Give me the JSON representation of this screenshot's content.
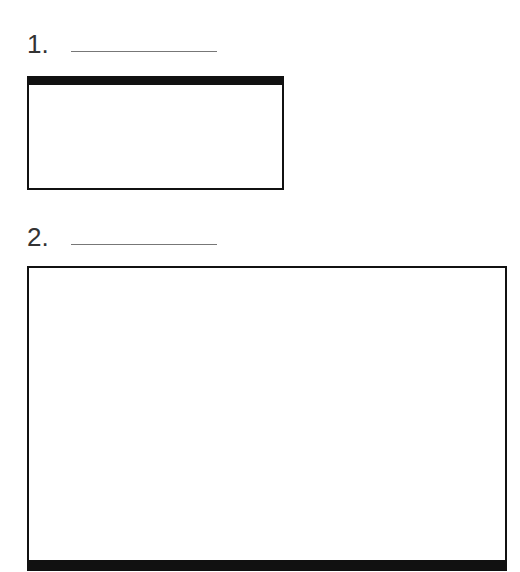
{
  "items": [
    {
      "label": "1.",
      "answer": "",
      "box": {
        "accent_edge": "top"
      }
    },
    {
      "label": "2.",
      "answer": "",
      "box": {
        "accent_edge": "bottom"
      }
    }
  ],
  "colors": {
    "border": "#111111",
    "blank_line": "#777777",
    "background": "#ffffff"
  }
}
